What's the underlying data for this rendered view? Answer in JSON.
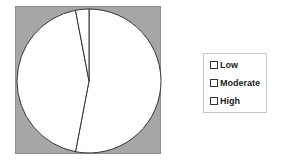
{
  "chart_data": {
    "type": "pie",
    "title": "",
    "categories": [
      "Low",
      "Moderate",
      "High"
    ],
    "values": [
      53,
      44,
      3
    ],
    "unit": "percent (estimated)",
    "start_angle_deg": 0,
    "direction": "clockwise",
    "slice_colors": [
      "#ffffff",
      "#ffffff",
      "#ffffff"
    ],
    "slice_border": "#333333",
    "plot_background": "#a6a6a6",
    "legend": {
      "position": "right",
      "entries": [
        "Low",
        "Moderate",
        "High"
      ]
    }
  },
  "legend": {
    "items": [
      {
        "label": "Low"
      },
      {
        "label": "Moderate"
      },
      {
        "label": "High"
      }
    ]
  }
}
